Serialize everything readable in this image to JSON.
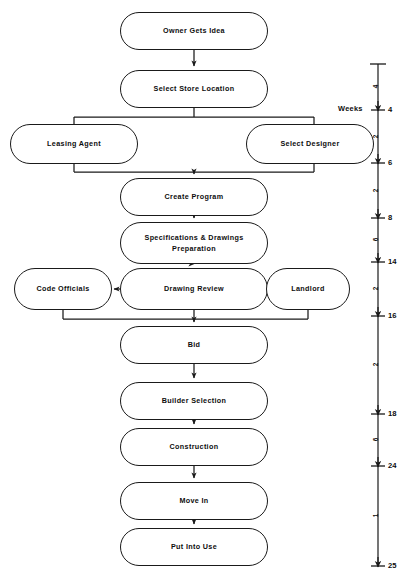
{
  "diagram": {
    "title_caption": "",
    "orientation": "vertical-flowchart",
    "line_color": "#1a1a1a",
    "background": "#ffffff",
    "nodes": [
      {
        "id": "owner-gets-idea",
        "label": "Owner Gets Idea",
        "x": 120,
        "y": 12,
        "w": 148,
        "h": 38
      },
      {
        "id": "select-store",
        "label": "Select Store Location",
        "x": 120,
        "y": 70,
        "w": 148,
        "h": 38
      },
      {
        "id": "leasing-agent",
        "label": "Leasing Agent",
        "x": 10,
        "y": 124,
        "w": 128,
        "h": 40
      },
      {
        "id": "select-designer",
        "label": "Select Designer",
        "x": 246,
        "y": 124,
        "w": 128,
        "h": 40
      },
      {
        "id": "create-program",
        "label": "Create Program",
        "x": 120,
        "y": 178,
        "w": 148,
        "h": 38
      },
      {
        "id": "specs-drawings",
        "label": "Specifications & Drawings\nPreparation",
        "x": 120,
        "y": 222,
        "w": 148,
        "h": 42
      },
      {
        "id": "code-officials",
        "label": "Code Officials",
        "x": 14,
        "y": 268,
        "w": 98,
        "h": 42
      },
      {
        "id": "drawing-review",
        "label": "Drawing Review",
        "x": 120,
        "y": 268,
        "w": 148,
        "h": 42
      },
      {
        "id": "landlord",
        "label": "Landlord",
        "x": 266,
        "y": 268,
        "w": 84,
        "h": 42
      },
      {
        "id": "bid",
        "label": "Bid",
        "x": 120,
        "y": 326,
        "w": 148,
        "h": 38
      },
      {
        "id": "builder-selection",
        "label": "Builder Selection",
        "x": 120,
        "y": 382,
        "w": 148,
        "h": 38
      },
      {
        "id": "construction",
        "label": "Construction",
        "x": 120,
        "y": 428,
        "w": 148,
        "h": 38
      },
      {
        "id": "move-in",
        "label": "Move In",
        "x": 120,
        "y": 482,
        "w": 148,
        "h": 38
      },
      {
        "id": "put-into-use",
        "label": "Put Into Use",
        "x": 120,
        "y": 528,
        "w": 148,
        "h": 38
      }
    ],
    "timeline": {
      "axis_label": "Weeks",
      "axis_label_x": 338,
      "axis_label_y": 104,
      "axis_x": 378,
      "axis_top": 64,
      "axis_bottom": 566,
      "ticks": [
        {
          "value": "",
          "y": 64,
          "cap": true,
          "arrow": false
        },
        {
          "value": "4",
          "y": 110,
          "cap": false,
          "arrow": true
        },
        {
          "value": "6",
          "y": 163,
          "cap": false,
          "arrow": true
        },
        {
          "value": "8",
          "y": 218,
          "cap": false,
          "arrow": true
        },
        {
          "value": "14",
          "y": 262,
          "cap": false,
          "arrow": true
        },
        {
          "value": "16",
          "y": 316,
          "cap": false,
          "arrow": true
        },
        {
          "value": "18",
          "y": 414,
          "cap": false,
          "arrow": true
        },
        {
          "value": "24",
          "y": 466,
          "cap": false,
          "arrow": true
        },
        {
          "value": "25",
          "y": 566,
          "cap": false,
          "arrow": true
        }
      ],
      "intervals": [
        {
          "value": "4",
          "y": 87
        },
        {
          "value": "2",
          "y": 137
        },
        {
          "value": "2",
          "y": 191
        },
        {
          "value": "6",
          "y": 240
        },
        {
          "value": "2",
          "y": 289
        },
        {
          "value": "2",
          "y": 365
        },
        {
          "value": "6",
          "y": 440
        },
        {
          "value": "1",
          "y": 516
        }
      ]
    }
  }
}
